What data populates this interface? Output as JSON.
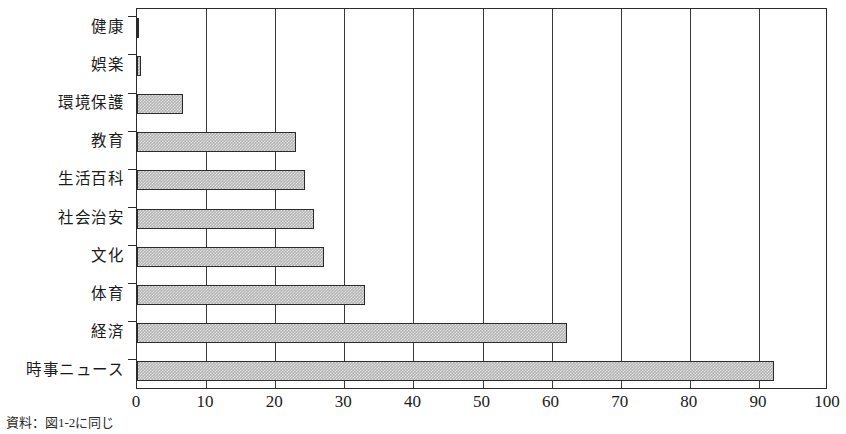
{
  "figure": {
    "source_note": "資料：図1-2に同じ"
  },
  "chart_data": {
    "type": "bar",
    "orientation": "horizontal",
    "title": "",
    "xlabel": "",
    "ylabel": "",
    "xlim": [
      0,
      100
    ],
    "xticks": [
      0,
      10,
      20,
      30,
      40,
      50,
      60,
      70,
      80,
      90,
      100
    ],
    "xtick_labels": [
      "0",
      "10",
      "20",
      "30",
      "40",
      "50",
      "60",
      "70",
      "80",
      "90",
      "100"
    ],
    "grid": true,
    "grid_axis": "x",
    "legend": null,
    "bar_fill_color": "#b4b4b4",
    "bar_edge_color": "#2b2b2b",
    "categories": [
      "健康",
      "娯楽",
      "環境保護",
      "教育",
      "生活百科",
      "社会治安",
      "文化",
      "体育",
      "経済",
      "時事ニュース"
    ],
    "values": [
      0.3,
      0.6,
      6.7,
      23.0,
      24.3,
      25.6,
      27.0,
      33.0,
      62.2,
      92.2
    ]
  }
}
